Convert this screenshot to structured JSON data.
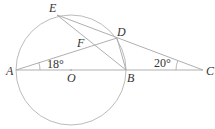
{
  "figure": {
    "type": "geometry",
    "colors": {
      "line": "#a6a6a6",
      "circle": "#b3b3b3",
      "text": "#333333"
    },
    "points": {
      "A": {
        "label": "A",
        "x": 16,
        "y": 70
      },
      "O": {
        "label": "O",
        "x": 71,
        "y": 70
      },
      "B": {
        "label": "B",
        "x": 126,
        "y": 70
      },
      "C": {
        "label": "C",
        "x": 203,
        "y": 70
      },
      "D": {
        "label": "D",
        "x": 117,
        "y": 38
      },
      "E": {
        "label": "E",
        "x": 57,
        "y": 15
      },
      "F": {
        "label": "F",
        "x": 0,
        "y": 0
      }
    },
    "circle": {
      "center": "O",
      "radius": 55
    },
    "angles": [
      {
        "vertex": "A",
        "label": "18°",
        "between": [
          "AB",
          "AD"
        ]
      },
      {
        "vertex": "C",
        "label": "20°",
        "between": [
          "CB",
          "CD"
        ]
      }
    ],
    "segments": [
      "AC",
      "AD",
      "CE",
      "EB",
      "DB"
    ]
  }
}
